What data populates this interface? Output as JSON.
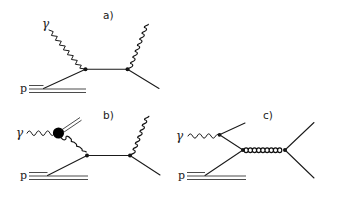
{
  "figure": {
    "kind": "feynman-diagram-set",
    "background_color": "#ffffff",
    "line_color": "#1a1a1a",
    "width": 338,
    "height": 207,
    "panels": [
      {
        "id": "a",
        "label": "a)",
        "label_x": 103,
        "label_y": 18,
        "incoming_photon_label": "γ",
        "incoming_proton_label": "p",
        "elements": [
          "photon-wavy-line-incoming",
          "quark-line-from-proton",
          "quark-propagator",
          "gluon-emission-coil",
          "outgoing-quark-line",
          "proton-three-quark-lines",
          "vertex-left",
          "vertex-right"
        ]
      },
      {
        "id": "b",
        "label": "b)",
        "label_x": 103,
        "label_y": 118,
        "incoming_photon_label": "γ",
        "incoming_proton_label": "p",
        "elements": [
          "photon-wavy-line-incoming",
          "blob-vertex",
          "outgoing-double-line-from-blob",
          "gluon-coil-from-blob",
          "quark-line-from-proton",
          "quark-propagator",
          "gluon-emission-coil",
          "outgoing-quark-line",
          "proton-three-quark-lines",
          "vertex-mid",
          "vertex-right"
        ]
      },
      {
        "id": "c",
        "label": "c)",
        "label_x": 263,
        "label_y": 118,
        "incoming_photon_label": "γ",
        "incoming_proton_label": "p",
        "elements": [
          "photon-wavy-line-incoming",
          "outgoing-line-up-right",
          "quark-line-from-proton",
          "horizontal-gluon-propagator",
          "outgoing-line-up-right-2",
          "outgoing-line-down-right",
          "proton-three-quark-lines",
          "vertex-photon",
          "vertex-left",
          "vertex-right"
        ]
      }
    ],
    "glyphs": {
      "photon": "γ",
      "proton": "p"
    }
  }
}
